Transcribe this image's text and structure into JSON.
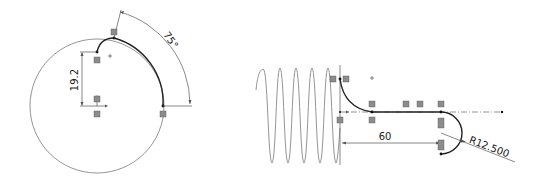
{
  "sketch_left": {
    "dimensions": {
      "vertical_distance": "19.2",
      "angle": "75°"
    },
    "relation_glyphs": [
      "coincident",
      "vertical",
      "vertical",
      "coincident",
      "coincident"
    ]
  },
  "sketch_right": {
    "dimensions": {
      "horizontal_distance": "60",
      "radius": "R12.500"
    },
    "sine_wave_cycles": 5,
    "relation_glyphs": [
      "coincident",
      "coincident",
      "horizontal",
      "horizontal",
      "coincident",
      "coincident",
      "tangent",
      "tangent",
      "coincident"
    ]
  },
  "colors": {
    "geometry": "#222222",
    "construction": "#7a7a7a",
    "background": "#ffffff"
  }
}
